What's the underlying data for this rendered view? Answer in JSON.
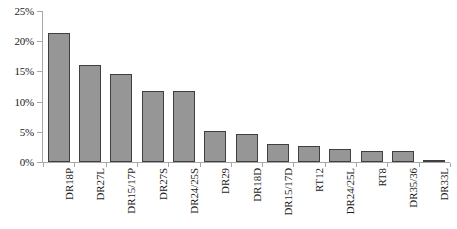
{
  "chart_data": {
    "type": "bar",
    "title": "",
    "xlabel": "",
    "ylabel": "",
    "ylim": [
      0,
      25
    ],
    "yticks": [
      0,
      5,
      10,
      15,
      20,
      25
    ],
    "ytick_labels": [
      "0%",
      "5%",
      "10%",
      "15%",
      "20%",
      "25%"
    ],
    "grid": false,
    "legend": "none",
    "bar_color": "#969696",
    "bar_border_color": "#3f3f3f",
    "axis_color": "#a8a8a8",
    "categories": [
      "DR18P",
      "DR27L",
      "DR15/17P",
      "DR27S",
      "DR24/25S",
      "DR29",
      "DR18D",
      "DR15/17D",
      "RT12",
      "DR24/25L",
      "RT8",
      "DR35/36",
      "DR33L"
    ],
    "values": [
      21.4,
      16.0,
      14.5,
      11.7,
      11.7,
      5.1,
      4.6,
      3.0,
      2.7,
      2.1,
      1.9,
      1.8,
      0.4
    ]
  }
}
